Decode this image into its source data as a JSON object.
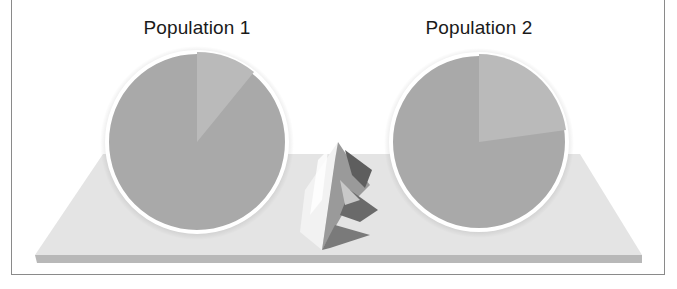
{
  "figure": {
    "populations": [
      {
        "label": "Population 1",
        "slice_fraction": 0.11
      },
      {
        "label": "Population 2",
        "slice_fraction": 0.26
      }
    ],
    "colors": {
      "pie_main": "#a9a9a9",
      "pie_slice": "#bdbdbd",
      "pie_ring": "#ffffff",
      "platform_top": "#e3e3e3",
      "platform_edge": "#b5b5b5",
      "frame": "#8a8a8a"
    },
    "center_icon": "iceberg-mountain-icon"
  }
}
